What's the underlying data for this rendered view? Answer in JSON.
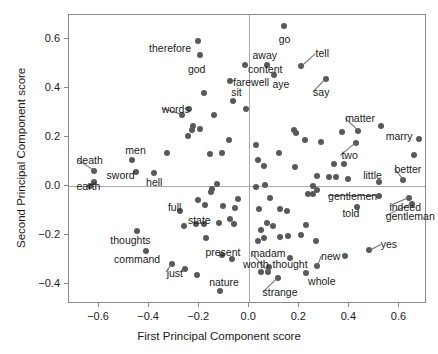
{
  "chart_data": {
    "type": "scatter",
    "title": "",
    "xlabel": "First Principal Component score",
    "ylabel": "Second Principal Component score",
    "xlim": [
      -0.72,
      0.71
    ],
    "ylim": [
      -0.48,
      0.7
    ],
    "xticks": [
      -0.6,
      -0.4,
      -0.2,
      0.0,
      0.2,
      0.4,
      0.6
    ],
    "xticklabels": [
      "−0.6",
      "−0.4",
      "−0.2",
      "0.0",
      "0.2",
      "0.4",
      "0.6"
    ],
    "yticks": [
      -0.4,
      -0.2,
      0.0,
      0.2,
      0.4,
      0.6
    ],
    "yticklabels": [
      "−0.4",
      "−0.2",
      "0.0",
      "0.2",
      "0.4",
      "0.6"
    ],
    "grid": false,
    "reference_lines": {
      "hline": 0.0,
      "vline": 0.0
    },
    "marker_color": "#595959",
    "legend": null,
    "points": [
      {
        "x": -0.205,
        "y": 0.595,
        "label": "therefore",
        "lx": -0.4,
        "ly": 0.565,
        "anchor": "start",
        "leader": false
      },
      {
        "x": -0.195,
        "y": 0.535,
        "label": "god",
        "lx": -0.245,
        "ly": 0.478,
        "anchor": "start",
        "leader": false
      },
      {
        "x": -0.017,
        "y": 0.497,
        "label": "content",
        "lx": -0.005,
        "ly": 0.478,
        "anchor": "start",
        "leader": false
      },
      {
        "x": 0.137,
        "y": 0.655,
        "label": "go",
        "lx": 0.118,
        "ly": 0.6,
        "anchor": "start",
        "leader": false
      },
      {
        "x": 0.071,
        "y": 0.497,
        "label": "away",
        "lx": 0.013,
        "ly": 0.537,
        "anchor": "start",
        "leader": false
      },
      {
        "x": 0.098,
        "y": 0.455,
        "label": "aye",
        "lx": 0.093,
        "ly": 0.418,
        "anchor": "start",
        "leader": false
      },
      {
        "x": 0.208,
        "y": 0.49,
        "label": "tell",
        "lx": 0.265,
        "ly": 0.543,
        "anchor": "start",
        "leader": true
      },
      {
        "x": 0.305,
        "y": 0.438,
        "label": "say",
        "lx": 0.255,
        "ly": 0.385,
        "anchor": "start",
        "leader": true
      },
      {
        "x": -0.075,
        "y": 0.432,
        "label": "farewell",
        "lx": -0.065,
        "ly": 0.425,
        "anchor": "start",
        "leader": false
      },
      {
        "x": -0.063,
        "y": 0.348,
        "label": "sit",
        "lx": -0.072,
        "ly": 0.385,
        "anchor": "start",
        "leader": false
      },
      {
        "x": -0.268,
        "y": 0.292,
        "label": "words",
        "lx": -0.35,
        "ly": 0.318,
        "anchor": "start",
        "leader": true
      },
      {
        "x": 0.435,
        "y": 0.228,
        "label": "matter",
        "lx": 0.383,
        "ly": 0.278,
        "anchor": "start",
        "leader": true
      },
      {
        "x": 0.528,
        "y": 0.247,
        "label": "marry",
        "lx": 0.545,
        "ly": 0.205,
        "anchor": "start",
        "leader": false
      },
      {
        "x": 0.428,
        "y": 0.178,
        "label": "two",
        "lx": 0.368,
        "ly": 0.127,
        "anchor": "start",
        "leader": true
      },
      {
        "x": -0.622,
        "y": 0.062,
        "label": "death",
        "lx": -0.69,
        "ly": 0.108,
        "anchor": "start",
        "leader": true
      },
      {
        "x": -0.47,
        "y": 0.108,
        "label": "men",
        "lx": -0.495,
        "ly": 0.148,
        "anchor": "start",
        "leader": false
      },
      {
        "x": -0.622,
        "y": 0.018,
        "label": "sword",
        "lx": -0.57,
        "ly": 0.048,
        "anchor": "start",
        "leader": false
      },
      {
        "x": -0.382,
        "y": 0.053,
        "label": "hell",
        "lx": -0.412,
        "ly": 0.018,
        "anchor": "start",
        "leader": false
      },
      {
        "x": -0.638,
        "y": 0.0,
        "label": "earth",
        "lx": -0.69,
        "ly": 0.0,
        "anchor": "start",
        "leader": false
      },
      {
        "x": 0.52,
        "y": 0.02,
        "label": "little",
        "lx": 0.455,
        "ly": 0.048,
        "anchor": "start",
        "leader": false
      },
      {
        "x": 0.615,
        "y": 0.028,
        "label": "better",
        "lx": 0.58,
        "ly": 0.072,
        "anchor": "start",
        "leader": true
      },
      {
        "x": 0.52,
        "y": -0.04,
        "label": "gentlemen",
        "lx": 0.315,
        "ly": -0.04,
        "anchor": "start",
        "leader": true
      },
      {
        "x": 0.638,
        "y": -0.048,
        "label": "indeed",
        "lx": 0.56,
        "ly": -0.082,
        "anchor": "start",
        "leader": true
      },
      {
        "x": 0.652,
        "y": -0.072,
        "label": "gentleman",
        "lx": 0.545,
        "ly": -0.122,
        "anchor": "start",
        "leader": true
      },
      {
        "x": 0.432,
        "y": -0.082,
        "label": "told",
        "lx": 0.372,
        "ly": -0.108,
        "anchor": "start",
        "leader": false
      },
      {
        "x": -0.278,
        "y": -0.102,
        "label": "full",
        "lx": -0.325,
        "ly": -0.085,
        "anchor": "start",
        "leader": false
      },
      {
        "x": -0.262,
        "y": -0.16,
        "label": "state",
        "lx": -0.245,
        "ly": -0.135,
        "anchor": "start",
        "leader": false
      },
      {
        "x": -0.448,
        "y": -0.182,
        "label": "thoughts",
        "lx": -0.555,
        "ly": -0.218,
        "anchor": "start",
        "leader": false
      },
      {
        "x": -0.412,
        "y": -0.262,
        "label": "command",
        "lx": -0.54,
        "ly": -0.298,
        "anchor": "start",
        "leader": false
      },
      {
        "x": -0.308,
        "y": -0.318,
        "label": "just",
        "lx": -0.33,
        "ly": -0.352,
        "anchor": "start",
        "leader": true
      },
      {
        "x": -0.11,
        "y": -0.278,
        "label": "present",
        "lx": -0.175,
        "ly": -0.268,
        "anchor": "start",
        "leader": false
      },
      {
        "x": -0.118,
        "y": -0.428,
        "label": "nature",
        "lx": -0.16,
        "ly": -0.392,
        "anchor": "start",
        "leader": false
      },
      {
        "x": 0.048,
        "y": -0.348,
        "label": "worth",
        "lx": -0.025,
        "ly": -0.318,
        "anchor": "start",
        "leader": false
      },
      {
        "x": 0.08,
        "y": -0.33,
        "label": "thought",
        "lx": 0.093,
        "ly": -0.318,
        "anchor": "start",
        "leader": false
      },
      {
        "x": 0.073,
        "y": -0.348,
        "label": "madam",
        "lx": 0.005,
        "ly": -0.272,
        "anchor": "start",
        "leader": true
      },
      {
        "x": 0.113,
        "y": -0.372,
        "label": "strange",
        "lx": 0.053,
        "ly": -0.432,
        "anchor": "start",
        "leader": true
      },
      {
        "x": 0.228,
        "y": -0.352,
        "label": "whole",
        "lx": 0.235,
        "ly": -0.388,
        "anchor": "start",
        "leader": false
      },
      {
        "x": 0.272,
        "y": -0.325,
        "label": "new",
        "lx": 0.287,
        "ly": -0.283,
        "anchor": "start",
        "leader": true
      },
      {
        "x": 0.478,
        "y": -0.258,
        "label": "yes",
        "lx": 0.525,
        "ly": -0.233,
        "anchor": "start",
        "leader": true
      },
      {
        "x": -0.18,
        "y": 0.382,
        "label": "",
        "lx": 0,
        "ly": 0,
        "anchor": "start",
        "leader": false
      },
      {
        "x": -0.142,
        "y": 0.29,
        "label": "",
        "lx": 0,
        "ly": 0,
        "anchor": "start",
        "leader": false
      },
      {
        "x": -0.225,
        "y": 0.248,
        "label": "",
        "lx": 0,
        "ly": 0,
        "anchor": "start",
        "leader": false
      },
      {
        "x": -0.228,
        "y": 0.232,
        "label": "",
        "lx": 0,
        "ly": 0,
        "anchor": "start",
        "leader": false
      },
      {
        "x": -0.198,
        "y": 0.235,
        "label": "",
        "lx": 0,
        "ly": 0,
        "anchor": "start",
        "leader": false
      },
      {
        "x": -0.243,
        "y": 0.207,
        "label": "",
        "lx": 0,
        "ly": 0,
        "anchor": "start",
        "leader": false
      },
      {
        "x": -0.24,
        "y": 0.315,
        "label": "",
        "lx": 0,
        "ly": 0,
        "anchor": "start",
        "leader": false
      },
      {
        "x": -0.012,
        "y": 0.318,
        "label": "",
        "lx": 0,
        "ly": 0,
        "anchor": "start",
        "leader": false
      },
      {
        "x": 0.028,
        "y": 0.168,
        "label": "",
        "lx": 0,
        "ly": 0,
        "anchor": "start",
        "leader": false
      },
      {
        "x": 0.033,
        "y": 0.108,
        "label": "",
        "lx": 0,
        "ly": 0,
        "anchor": "start",
        "leader": false
      },
      {
        "x": -0.33,
        "y": 0.137,
        "label": "",
        "lx": 0,
        "ly": 0,
        "anchor": "start",
        "leader": false
      },
      {
        "x": -0.158,
        "y": 0.133,
        "label": "",
        "lx": 0,
        "ly": 0,
        "anchor": "start",
        "leader": false
      },
      {
        "x": -0.082,
        "y": 0.19,
        "label": "",
        "lx": 0,
        "ly": 0,
        "anchor": "start",
        "leader": false
      },
      {
        "x": -0.108,
        "y": 0.135,
        "label": "",
        "lx": 0,
        "ly": 0,
        "anchor": "start",
        "leader": false
      },
      {
        "x": 0.18,
        "y": 0.232,
        "label": "",
        "lx": 0,
        "ly": 0,
        "anchor": "start",
        "leader": false
      },
      {
        "x": 0.186,
        "y": 0.218,
        "label": "",
        "lx": 0,
        "ly": 0,
        "anchor": "start",
        "leader": false
      },
      {
        "x": 0.222,
        "y": 0.188,
        "label": "",
        "lx": 0,
        "ly": 0,
        "anchor": "start",
        "leader": false
      },
      {
        "x": 0.372,
        "y": 0.222,
        "label": "",
        "lx": 0,
        "ly": 0,
        "anchor": "start",
        "leader": false
      },
      {
        "x": 0.288,
        "y": 0.18,
        "label": "",
        "lx": 0,
        "ly": 0,
        "anchor": "start",
        "leader": false
      },
      {
        "x": 0.118,
        "y": 0.138,
        "label": "",
        "lx": 0,
        "ly": 0,
        "anchor": "start",
        "leader": false
      },
      {
        "x": 0.058,
        "y": 0.083,
        "label": "",
        "lx": 0,
        "ly": 0,
        "anchor": "start",
        "leader": false
      },
      {
        "x": 0.182,
        "y": 0.078,
        "label": "",
        "lx": 0,
        "ly": 0,
        "anchor": "start",
        "leader": false
      },
      {
        "x": 0.338,
        "y": 0.092,
        "label": "",
        "lx": 0,
        "ly": 0,
        "anchor": "start",
        "leader": false
      },
      {
        "x": 0.378,
        "y": 0.09,
        "label": "",
        "lx": 0,
        "ly": 0,
        "anchor": "start",
        "leader": false
      },
      {
        "x": 0.318,
        "y": 0.04,
        "label": "",
        "lx": 0,
        "ly": 0,
        "anchor": "start",
        "leader": false
      },
      {
        "x": 0.348,
        "y": 0.038,
        "label": "",
        "lx": 0,
        "ly": 0,
        "anchor": "start",
        "leader": false
      },
      {
        "x": 0.272,
        "y": 0.042,
        "label": "",
        "lx": 0,
        "ly": 0,
        "anchor": "start",
        "leader": false
      },
      {
        "x": 0.395,
        "y": 0.032,
        "label": "",
        "lx": 0,
        "ly": 0,
        "anchor": "start",
        "leader": false
      },
      {
        "x": 0.678,
        "y": 0.195,
        "label": "",
        "lx": 0,
        "ly": 0,
        "anchor": "start",
        "leader": false
      },
      {
        "x": 0.658,
        "y": 0.128,
        "label": "",
        "lx": 0,
        "ly": 0,
        "anchor": "start",
        "leader": false
      },
      {
        "x": -0.452,
        "y": 0.058,
        "label": "",
        "lx": 0,
        "ly": 0,
        "anchor": "start",
        "leader": false
      },
      {
        "x": -0.128,
        "y": 0.012,
        "label": "",
        "lx": 0,
        "ly": 0,
        "anchor": "start",
        "leader": false
      },
      {
        "x": -0.148,
        "y": -0.01,
        "label": "",
        "lx": 0,
        "ly": 0,
        "anchor": "start",
        "leader": false
      },
      {
        "x": -0.152,
        "y": -0.022,
        "label": "",
        "lx": 0,
        "ly": 0,
        "anchor": "start",
        "leader": false
      },
      {
        "x": 0.026,
        "y": -0.003,
        "label": "",
        "lx": 0,
        "ly": 0,
        "anchor": "start",
        "leader": false
      },
      {
        "x": 0.062,
        "y": 0.005,
        "label": "",
        "lx": 0,
        "ly": 0,
        "anchor": "start",
        "leader": false
      },
      {
        "x": 0.255,
        "y": 0.002,
        "label": "",
        "lx": 0,
        "ly": 0,
        "anchor": "start",
        "leader": false
      },
      {
        "x": 0.272,
        "y": -0.015,
        "label": "",
        "lx": 0,
        "ly": 0,
        "anchor": "start",
        "leader": false
      },
      {
        "x": 0.256,
        "y": -0.03,
        "label": "",
        "lx": 0,
        "ly": 0,
        "anchor": "start",
        "leader": false
      },
      {
        "x": 0.235,
        "y": -0.032,
        "label": "",
        "lx": 0,
        "ly": 0,
        "anchor": "start",
        "leader": false
      },
      {
        "x": 0.082,
        "y": -0.048,
        "label": "",
        "lx": 0,
        "ly": 0,
        "anchor": "start",
        "leader": false
      },
      {
        "x": -0.046,
        "y": -0.053,
        "label": "",
        "lx": 0,
        "ly": 0,
        "anchor": "start",
        "leader": false
      },
      {
        "x": -0.205,
        "y": -0.055,
        "label": "",
        "lx": 0,
        "ly": 0,
        "anchor": "start",
        "leader": false
      },
      {
        "x": -0.178,
        "y": -0.075,
        "label": "",
        "lx": 0,
        "ly": 0,
        "anchor": "start",
        "leader": false
      },
      {
        "x": -0.105,
        "y": -0.078,
        "label": "",
        "lx": 0,
        "ly": 0,
        "anchor": "start",
        "leader": false
      },
      {
        "x": -0.058,
        "y": -0.088,
        "label": "",
        "lx": 0,
        "ly": 0,
        "anchor": "start",
        "leader": false
      },
      {
        "x": 0.04,
        "y": -0.092,
        "label": "",
        "lx": 0,
        "ly": 0,
        "anchor": "start",
        "leader": false
      },
      {
        "x": 0.122,
        "y": -0.092,
        "label": "",
        "lx": 0,
        "ly": 0,
        "anchor": "start",
        "leader": false
      },
      {
        "x": 0.152,
        "y": -0.102,
        "label": "",
        "lx": 0,
        "ly": 0,
        "anchor": "start",
        "leader": false
      },
      {
        "x": -0.078,
        "y": -0.132,
        "label": "",
        "lx": 0,
        "ly": 0,
        "anchor": "start",
        "leader": false
      },
      {
        "x": -0.182,
        "y": -0.152,
        "label": "",
        "lx": 0,
        "ly": 0,
        "anchor": "start",
        "leader": false
      },
      {
        "x": -0.212,
        "y": -0.152,
        "label": "",
        "lx": 0,
        "ly": 0,
        "anchor": "start",
        "leader": false
      },
      {
        "x": -0.122,
        "y": -0.15,
        "label": "",
        "lx": 0,
        "ly": 0,
        "anchor": "start",
        "leader": false
      },
      {
        "x": -0.062,
        "y": -0.155,
        "label": "",
        "lx": 0,
        "ly": 0,
        "anchor": "start",
        "leader": false
      },
      {
        "x": 0.228,
        "y": -0.158,
        "label": "",
        "lx": 0,
        "ly": 0,
        "anchor": "start",
        "leader": false
      },
      {
        "x": 0.072,
        "y": -0.15,
        "label": "",
        "lx": 0,
        "ly": 0,
        "anchor": "start",
        "leader": false
      },
      {
        "x": 0.095,
        "y": -0.162,
        "label": "",
        "lx": 0,
        "ly": 0,
        "anchor": "start",
        "leader": false
      },
      {
        "x": 0.048,
        "y": -0.178,
        "label": "",
        "lx": 0,
        "ly": 0,
        "anchor": "start",
        "leader": false
      },
      {
        "x": 0.155,
        "y": -0.202,
        "label": "",
        "lx": 0,
        "ly": 0,
        "anchor": "start",
        "leader": false
      },
      {
        "x": 0.122,
        "y": -0.205,
        "label": "",
        "lx": 0,
        "ly": 0,
        "anchor": "start",
        "leader": false
      },
      {
        "x": 0.205,
        "y": -0.198,
        "label": "",
        "lx": 0,
        "ly": 0,
        "anchor": "start",
        "leader": false
      },
      {
        "x": 0.058,
        "y": -0.212,
        "label": "",
        "lx": 0,
        "ly": 0,
        "anchor": "start",
        "leader": false
      },
      {
        "x": 0.035,
        "y": -0.222,
        "label": "",
        "lx": 0,
        "ly": 0,
        "anchor": "start",
        "leader": false
      },
      {
        "x": 0.268,
        "y": -0.222,
        "label": "",
        "lx": 0,
        "ly": 0,
        "anchor": "start",
        "leader": false
      },
      {
        "x": -0.172,
        "y": -0.21,
        "label": "",
        "lx": 0,
        "ly": 0,
        "anchor": "start",
        "leader": false
      },
      {
        "x": -0.07,
        "y": -0.298,
        "label": "",
        "lx": 0,
        "ly": 0,
        "anchor": "start",
        "leader": false
      },
      {
        "x": 0.162,
        "y": -0.292,
        "label": "",
        "lx": 0,
        "ly": 0,
        "anchor": "start",
        "leader": false
      },
      {
        "x": 0.382,
        "y": -0.282,
        "label": "",
        "lx": 0,
        "ly": 0,
        "anchor": "start",
        "leader": false
      },
      {
        "x": -0.258,
        "y": -0.338,
        "label": "",
        "lx": 0,
        "ly": 0,
        "anchor": "start",
        "leader": false
      },
      {
        "x": -0.21,
        "y": -0.362,
        "label": "",
        "lx": 0,
        "ly": 0,
        "anchor": "start",
        "leader": false
      }
    ]
  }
}
